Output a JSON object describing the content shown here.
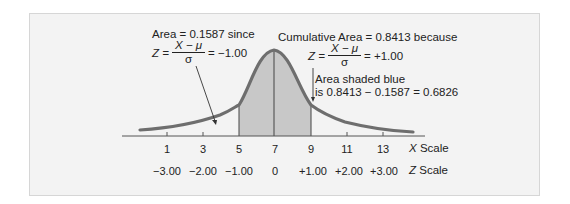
{
  "annotations": {
    "left": {
      "title": "Area = 0.1587 since",
      "z_label": "Z =",
      "numerator": "X − μ",
      "denominator": "σ",
      "result": "= −1.00"
    },
    "right": {
      "title": "Cumulative Area = 0.8413 because",
      "z_label": "Z =",
      "numerator": "X − μ",
      "denominator": "σ",
      "result": "= +1.00"
    },
    "shaded": {
      "line1": "Area shaded blue",
      "line2": "is 0.8413 − 0.1587 = 0.6826"
    }
  },
  "x_scale": {
    "label_var": "X",
    "label_word": "Scale",
    "ticks": [
      "1",
      "3",
      "5",
      "7",
      "9",
      "11",
      "13"
    ]
  },
  "z_scale": {
    "label_var": "Z",
    "label_word": "Scale",
    "ticks": [
      "−3.00",
      "−2.00",
      "−1.00",
      "0",
      "+1.00",
      "+2.00",
      "+3.00"
    ]
  },
  "colors": {
    "curve": "#6e6e6e",
    "shade": "#c8c8c8",
    "panel": "#f3f3f3",
    "axis": "#555555"
  },
  "distribution": {
    "mean": 7,
    "std_dev": 2,
    "shaded_from": 5,
    "shaded_to": 9
  }
}
